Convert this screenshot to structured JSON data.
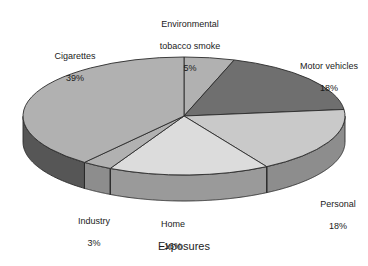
{
  "caption": "Exposures",
  "colors": {
    "background": "#ffffff",
    "text": "#1b1b1b",
    "outline": "#2a2a2a",
    "slice_dark": "#6f6f6f",
    "slice_mid": "#b1b1b1",
    "slice_light": "#c9c9c9",
    "slice_lightest": "#dcdcdc",
    "side_dark": "#565656",
    "side_mid": "#8d8d8d",
    "side_light": "#9a9a9a"
  },
  "chart_data": {
    "type": "pie",
    "title": "",
    "xlabel": "Exposures",
    "ylabel": "",
    "legend_position": "none",
    "three_d": true,
    "start_angle_deg": -90,
    "direction": "clockwise",
    "units": "percent",
    "total": 99,
    "categories": [
      "Environmental tobacco smoke",
      "Motor vehicles",
      "Personal",
      "Home",
      "Industry",
      "Cigarettes"
    ],
    "values": [
      5,
      18,
      18,
      16,
      3,
      39
    ],
    "slices": [
      {
        "key": "ets",
        "name": "Environmental tobacco smoke",
        "label_line1": "Environmental",
        "label_line2": "tobacco smoke",
        "value": 5,
        "value_label": "5%",
        "top_color": "#b1b1b1",
        "side_color": "#8d8d8d"
      },
      {
        "key": "motor",
        "name": "Motor vehicles",
        "label_line1": "Motor vehicles",
        "label_line2": "",
        "value": 18,
        "value_label": "18%",
        "top_color": "#6f6f6f",
        "side_color": "#565656"
      },
      {
        "key": "personal",
        "name": "Personal",
        "label_line1": "Personal",
        "label_line2": "",
        "value": 18,
        "value_label": "18%",
        "top_color": "#c9c9c9",
        "side_color": "#8d8d8d"
      },
      {
        "key": "home",
        "name": "Home",
        "label_line1": "Home",
        "label_line2": "",
        "value": 16,
        "value_label": "16%",
        "top_color": "#dcdcdc",
        "side_color": "#9a9a9a"
      },
      {
        "key": "industry",
        "name": "Industry",
        "label_line1": "Industry",
        "label_line2": "",
        "value": 3,
        "value_label": "3%",
        "top_color": "#b1b1b1",
        "side_color": "#8d8d8d"
      },
      {
        "key": "cigarettes",
        "name": "Cigarettes",
        "label_line1": "Cigarettes",
        "label_line2": "",
        "value": 39,
        "value_label": "39%",
        "top_color": "#b1b1b1",
        "side_color": "#565656"
      }
    ]
  },
  "labels": {
    "ets": {
      "line1": "Environmental",
      "line2": "tobacco smoke",
      "pct": "5%"
    },
    "motor": {
      "line1": "Motor vehicles",
      "pct": "18%"
    },
    "personal": {
      "line1": "Personal",
      "pct": "18%"
    },
    "home": {
      "line1": "Home",
      "pct": "16%"
    },
    "industry": {
      "line1": "Industry",
      "pct": "3%"
    },
    "cigarettes": {
      "line1": "Cigarettes",
      "pct": "39%"
    }
  }
}
